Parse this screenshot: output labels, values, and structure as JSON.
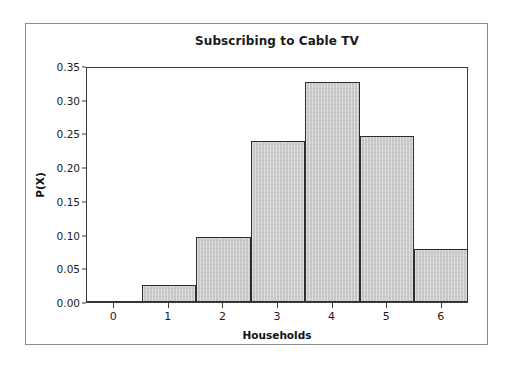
{
  "chart_data": {
    "type": "bar",
    "title": "Subscribing to Cable TV",
    "xlabel": "Households",
    "ylabel": "P(X)",
    "categories": [
      "0",
      "1",
      "2",
      "3",
      "4",
      "5",
      "6"
    ],
    "values": [
      0.001,
      0.025,
      0.096,
      0.239,
      0.326,
      0.246,
      0.079
    ],
    "ylim": [
      0.0,
      0.35
    ],
    "ytick_labels": [
      "0.00",
      "0.05",
      "0.10",
      "0.15",
      "0.20",
      "0.25",
      "0.30",
      "0.35"
    ],
    "ytick_values": [
      0.0,
      0.05,
      0.1,
      0.15,
      0.2,
      0.25,
      0.3,
      0.35
    ],
    "xtick_labels": [
      "0",
      "1",
      "2",
      "3",
      "4",
      "5",
      "6"
    ],
    "grid": false,
    "legend": null,
    "bar_fill_color": "#c9c9c9",
    "bar_edge_color": "#2e2e2e",
    "axis_color": "#3a3a3a",
    "frame_color": "#8a8a8a",
    "background_color": "#ffffff"
  }
}
